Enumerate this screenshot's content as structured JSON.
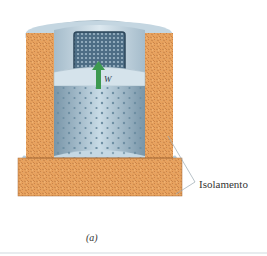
{
  "figure": {
    "caption": "(a)",
    "annotations": {
      "insulation_label": "Isolamento",
      "weight_label": "W"
    },
    "components": [
      {
        "name": "insulation",
        "color": "#e8a060"
      },
      {
        "name": "cylinder-gas",
        "color": "#8fb0c4"
      },
      {
        "name": "piston",
        "color": "#c9dae4"
      },
      {
        "name": "lead-shot-weight",
        "color": "#4e6f88"
      },
      {
        "name": "weight-arrow",
        "color": "#3d9a50"
      }
    ]
  }
}
